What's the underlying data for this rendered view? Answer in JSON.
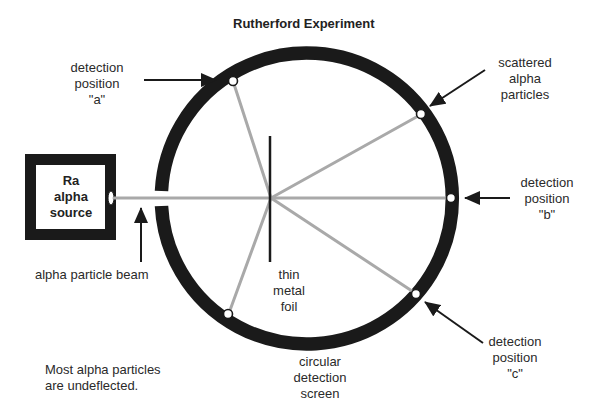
{
  "title": "Rutherford Experiment",
  "source": {
    "lines": [
      "Ra",
      "alpha",
      "source"
    ]
  },
  "labels": {
    "detection_a": [
      "detection",
      "position",
      "\"a\""
    ],
    "scattered": [
      "scattered",
      "alpha",
      "particles"
    ],
    "detection_b": [
      "detection",
      "position",
      "\"b\""
    ],
    "detection_c": [
      "detection",
      "position",
      "\"c\""
    ],
    "beam": "alpha particle beam",
    "foil": [
      "thin",
      "metal",
      "foil"
    ],
    "screen": [
      "circular",
      "detection",
      "screen"
    ],
    "note": [
      "Most alpha particles",
      "are undeflected."
    ]
  },
  "colors": {
    "ring": "#1a1a1a",
    "beam": "#a9a9a9",
    "foil": "#1a1a1a",
    "arrow": "#1a1a1a"
  }
}
